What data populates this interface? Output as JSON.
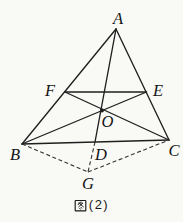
{
  "figure": {
    "ink_color": "#1f1f1f",
    "background": "#f9f9f6",
    "points": {
      "A": {
        "label": "A",
        "x": 116,
        "y": 29,
        "label_x": 118,
        "label_y": 24
      },
      "B": {
        "label": "B",
        "x": 22,
        "y": 144,
        "label_x": 15,
        "label_y": 160
      },
      "C": {
        "label": "C",
        "x": 169,
        "y": 140,
        "label_x": 174,
        "label_y": 156
      },
      "D": {
        "label": "D",
        "x": 95,
        "y": 142,
        "label_x": 101,
        "label_y": 160
      },
      "E": {
        "label": "E",
        "x": 146.5,
        "y": 92,
        "label_x": 158,
        "label_y": 96
      },
      "F": {
        "label": "F",
        "x": 65,
        "y": 92,
        "label_x": 50,
        "label_y": 96
      },
      "O": {
        "label": "O",
        "x": 102,
        "y": 110.5,
        "label_x": 107.5,
        "label_y": 127
      },
      "G": {
        "label": "G",
        "x": 88,
        "y": 172,
        "label_x": 88,
        "label_y": 189
      }
    },
    "solid_segments": [
      "AB",
      "AC",
      "BC",
      "FE",
      "BE",
      "CF",
      "AD"
    ],
    "dashed_segments": [
      "BG",
      "GC",
      "DG"
    ]
  },
  "caption": {
    "text": "图(2)",
    "figure_character": "图",
    "number_part": "(2)"
  }
}
